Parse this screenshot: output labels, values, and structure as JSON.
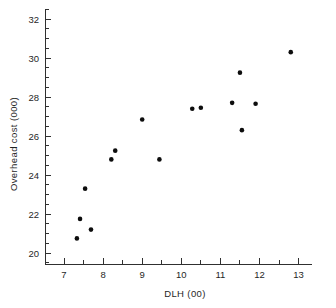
{
  "chart_data": {
    "type": "scatter",
    "title": "",
    "xlabel": "DLH (00)",
    "ylabel": "Overhead cost (000)",
    "xlim": [
      6.55,
      13.35
    ],
    "ylim": [
      19.3,
      32.5
    ],
    "xticks": [
      7,
      8,
      9,
      10,
      11,
      12,
      13
    ],
    "xtick_labels": [
      "7",
      "8",
      "9",
      "10",
      "11",
      "12",
      "13"
    ],
    "yticks": [
      20,
      22,
      24,
      26,
      28,
      30,
      32
    ],
    "ytick_labels": [
      "20",
      "22",
      "24",
      "26",
      "28",
      "30",
      "32"
    ],
    "minor_xtick_step": 0.5,
    "minor_ytick_step": 0.5,
    "grid": false,
    "legend": null,
    "marker": "filled-circle",
    "marker_color": "#0d0d0d",
    "marker_size": 4.6,
    "n_points": 15,
    "x": [
      7.33,
      7.41,
      7.54,
      7.69,
      8.21,
      8.31,
      9.0,
      9.44,
      10.28,
      10.5,
      11.3,
      11.5,
      11.55,
      11.9,
      12.8
    ],
    "y": [
      20.75,
      21.75,
      23.3,
      21.2,
      24.8,
      25.25,
      26.85,
      24.8,
      27.4,
      27.45,
      27.7,
      29.25,
      26.3,
      27.65,
      30.3
    ],
    "points": [
      {
        "x": 7.33,
        "y": 20.75
      },
      {
        "x": 7.41,
        "y": 21.75
      },
      {
        "x": 7.54,
        "y": 23.3
      },
      {
        "x": 7.69,
        "y": 21.2
      },
      {
        "x": 8.21,
        "y": 24.8
      },
      {
        "x": 8.31,
        "y": 25.25
      },
      {
        "x": 9.0,
        "y": 26.85
      },
      {
        "x": 9.44,
        "y": 24.8
      },
      {
        "x": 10.28,
        "y": 27.4
      },
      {
        "x": 10.5,
        "y": 27.45
      },
      {
        "x": 11.3,
        "y": 27.7
      },
      {
        "x": 11.5,
        "y": 29.25
      },
      {
        "x": 11.55,
        "y": 26.3
      },
      {
        "x": 11.9,
        "y": 27.65
      },
      {
        "x": 12.8,
        "y": 30.3
      }
    ]
  },
  "figure": {
    "background_color": "#ffffff",
    "axis_color": "#303030",
    "text_color": "#1f1f1f"
  }
}
